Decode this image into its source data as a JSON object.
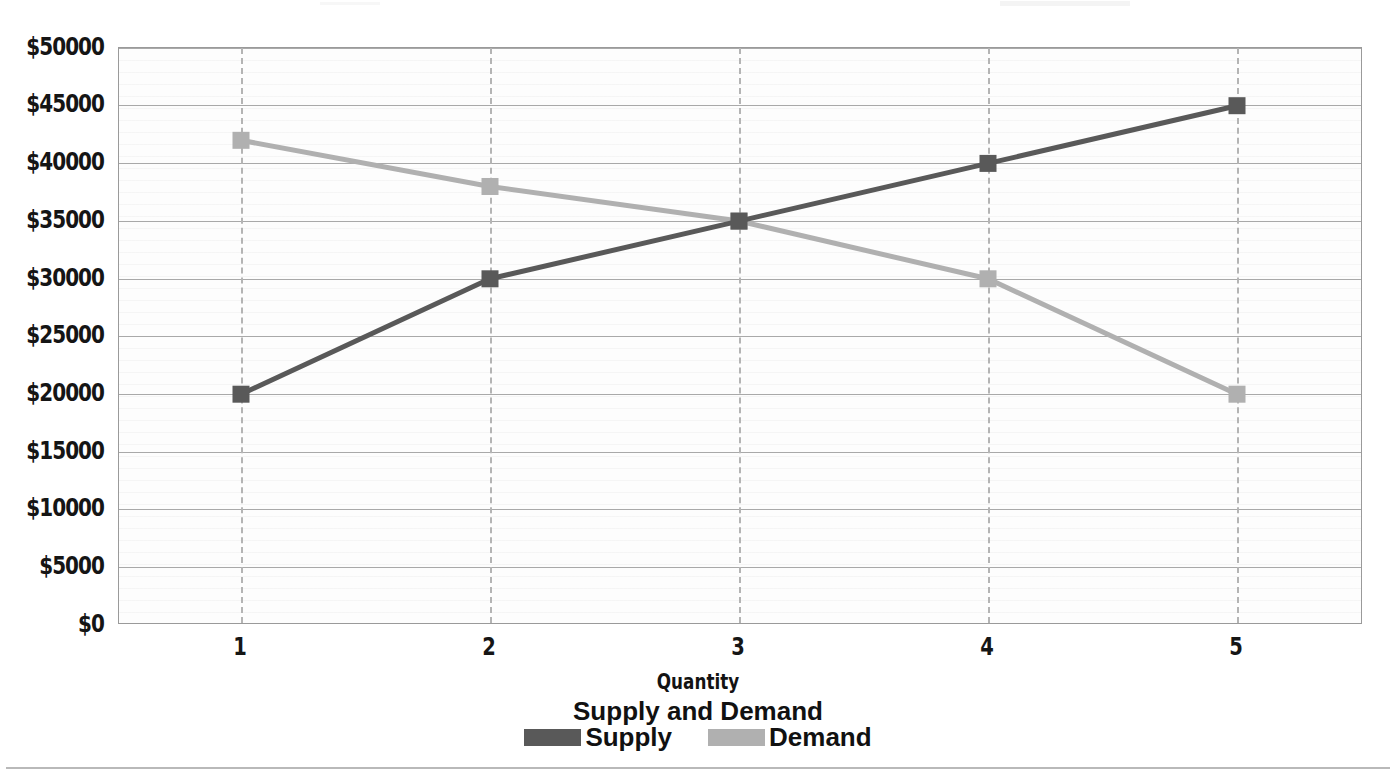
{
  "chart_data": {
    "type": "line",
    "title": "Supply and Demand",
    "xlabel": "Quantity",
    "ylabel": "",
    "categories": [
      "1",
      "2",
      "3",
      "4",
      "5"
    ],
    "x": [
      1,
      2,
      3,
      4,
      5
    ],
    "series": [
      {
        "name": "Supply",
        "color": "#595959",
        "marker": "square",
        "values": [
          20000,
          30000,
          35000,
          40000,
          45000
        ]
      },
      {
        "name": "Demand",
        "color": "#b0b0b0",
        "marker": "square",
        "values": [
          42000,
          38000,
          35000,
          30000,
          20000
        ]
      }
    ],
    "ylim": [
      0,
      50000
    ],
    "ytick_labels": [
      "$0",
      "$5000",
      "$10000",
      "$15000",
      "$20000",
      "$25000",
      "$30000",
      "$35000",
      "$40000",
      "$45000",
      "$50000"
    ],
    "ytick_values": [
      0,
      5000,
      10000,
      15000,
      20000,
      25000,
      30000,
      35000,
      40000,
      45000,
      50000
    ],
    "xtick_labels": [
      "1",
      "2",
      "3",
      "4",
      "5"
    ],
    "grid": {
      "horizontal": true,
      "vertical": true,
      "vertical_style": "dashed"
    },
    "legend_position": "bottom"
  },
  "legend": {
    "entries": [
      {
        "label": "Supply"
      },
      {
        "label": "Demand"
      }
    ]
  },
  "colors": {
    "supply": "#595959",
    "demand": "#b0b0b0",
    "grid": "#a9a9a9",
    "grid_vertical": "#b4b4b4",
    "axis_text": "#151515",
    "plot_background": "#fdfdfd",
    "frame": "#9a9a9a"
  }
}
